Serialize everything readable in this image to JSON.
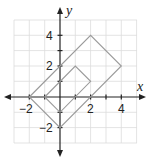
{
  "diagram": {
    "type": "coordinate-plane",
    "x_axis_label": "x",
    "y_axis_label": "y",
    "x_tick_labels": [
      "−2",
      "2",
      "4"
    ],
    "y_tick_labels": [
      "4",
      "2",
      "−2"
    ],
    "range": {
      "x": [
        -3,
        5
      ],
      "y": [
        -3,
        5
      ]
    },
    "grid": true,
    "shapes": [
      {
        "name": "large-rectangle",
        "vertices": [
          [
            -2,
            0
          ],
          [
            2,
            4
          ],
          [
            4,
            2
          ],
          [
            0,
            -2
          ]
        ]
      },
      {
        "name": "small-rectangle",
        "vertices": [
          [
            -1,
            0
          ],
          [
            1,
            2
          ],
          [
            2,
            1
          ],
          [
            0,
            -1
          ]
        ]
      }
    ],
    "colors": {
      "grid": "#d9d9d9",
      "axis": "#222222",
      "shape": "#999999"
    }
  }
}
